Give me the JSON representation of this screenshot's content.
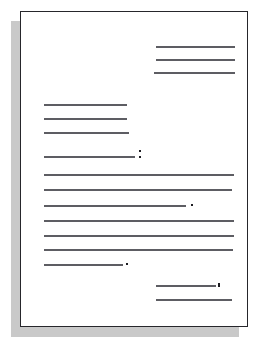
{
  "figure": {
    "name": "business-letter-layout-schematic",
    "caption": "",
    "page": {
      "border_color": "#26262b",
      "fill_color": "#ffffff",
      "shadow_color": "#c9c9c9"
    },
    "line_color": "#5d5d63",
    "mark_color": "#1d1d22"
  },
  "blocks": [
    {
      "id": "heading-block",
      "name": "heading-date-block",
      "alignment": "right",
      "line_count": 3,
      "lines": [
        {
          "name": "heading-line-1",
          "left": 157,
          "top": 47,
          "width": 79
        },
        {
          "name": "heading-line-2",
          "left": 157,
          "top": 60,
          "width": 79
        },
        {
          "name": "heading-line-3",
          "left": 155,
          "top": 73,
          "width": 81
        }
      ]
    },
    {
      "id": "inside-address-block",
      "name": "inside-address-block",
      "alignment": "left",
      "line_count": 3,
      "lines": [
        {
          "name": "address-line-1",
          "left": 45,
          "top": 105,
          "width": 83
        },
        {
          "name": "address-line-2",
          "left": 45,
          "top": 119,
          "width": 83
        },
        {
          "name": "address-line-3",
          "left": 45,
          "top": 133,
          "width": 85
        }
      ]
    },
    {
      "id": "salutation-block",
      "name": "salutation-block",
      "alignment": "left",
      "line_count": 1,
      "lines": [
        {
          "name": "salutation-line",
          "left": 45,
          "top": 157,
          "width": 91
        }
      ],
      "marks": [
        {
          "name": "salutation-colon-upper-dot",
          "type": "colon-top",
          "left": 140,
          "top": 151
        },
        {
          "name": "salutation-colon-lower-dot",
          "type": "colon-bottom",
          "left": 140,
          "top": 157
        }
      ]
    },
    {
      "id": "body-paragraph-1",
      "name": "body-paragraph-1",
      "alignment": "justified",
      "line_count": 3,
      "lines": [
        {
          "name": "body1-line-1",
          "left": 45,
          "top": 175,
          "width": 190
        },
        {
          "name": "body1-line-2",
          "left": 45,
          "top": 190,
          "width": 188
        },
        {
          "name": "body1-line-3",
          "left": 45,
          "top": 206,
          "width": 142
        }
      ],
      "marks": [
        {
          "name": "body1-terminal-period",
          "type": "dot",
          "left": 192,
          "top": 205
        }
      ]
    },
    {
      "id": "body-paragraph-2",
      "name": "body-paragraph-2",
      "alignment": "justified",
      "line_count": 4,
      "lines": [
        {
          "name": "body2-line-1",
          "left": 45,
          "top": 221,
          "width": 190
        },
        {
          "name": "body2-line-2",
          "left": 45,
          "top": 236,
          "width": 190
        },
        {
          "name": "body2-line-3",
          "left": 45,
          "top": 250,
          "width": 189
        },
        {
          "name": "body2-line-4",
          "left": 45,
          "top": 265,
          "width": 79
        }
      ],
      "marks": [
        {
          "name": "body2-terminal-period",
          "type": "dot",
          "left": 127,
          "top": 264
        }
      ]
    },
    {
      "id": "complimentary-close-block",
      "name": "complimentary-close-block",
      "alignment": "right",
      "line_count": 1,
      "lines": [
        {
          "name": "close-line",
          "left": 157,
          "top": 286,
          "width": 60
        }
      ],
      "marks": [
        {
          "name": "close-terminal-comma",
          "type": "comma",
          "left": 219,
          "top": 284
        }
      ]
    },
    {
      "id": "signature-block",
      "name": "signature-block",
      "alignment": "right",
      "line_count": 1,
      "lines": [
        {
          "name": "signature-line",
          "left": 157,
          "top": 300,
          "width": 76
        }
      ]
    }
  ]
}
